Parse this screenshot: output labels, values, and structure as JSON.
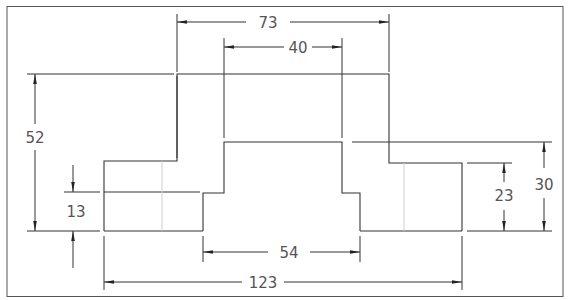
{
  "drawing": {
    "type": "orthographic-front-view",
    "line_color": "#333333",
    "hidden_line_color": "#c8c8c8",
    "border_color": "#444444"
  },
  "dimensions": {
    "top_width": "73",
    "inner_top_width": "40",
    "overall_height": "52",
    "left_step_height": "13",
    "bottom_inner_width": "54",
    "overall_width": "123",
    "right_shoulder_height": "23",
    "right_step_height": "30"
  }
}
